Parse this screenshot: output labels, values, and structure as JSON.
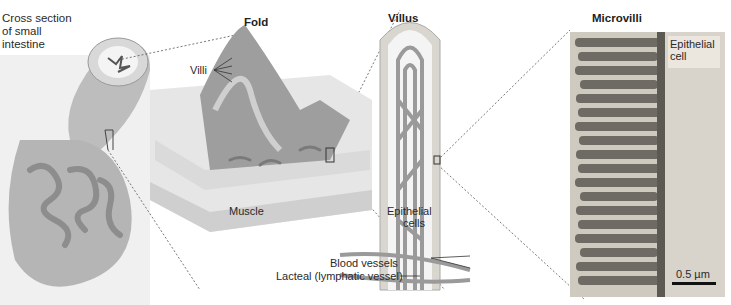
{
  "panels": {
    "cross_section": {
      "title_lines": [
        "Cross section",
        "of small",
        "intestine"
      ]
    },
    "fold": {
      "title": "Fold",
      "labels": {
        "villi": "Villi",
        "muscle": "Muscle"
      }
    },
    "villus": {
      "title": "Villus",
      "labels": {
        "epithelial_cells_1": "Epithelial",
        "epithelial_cells_2": "cells",
        "blood_vessels": "Blood vessels",
        "lacteal": "Lacteal (lymphatic vessel)"
      }
    },
    "microvilli": {
      "title": "Microvilli",
      "labels": {
        "epithelial_cell_1": "Epithelial",
        "epithelial_cell_2": "cell"
      },
      "scale_bar": "0.5 µm"
    }
  },
  "colors": {
    "tissue": "#c8c8c8",
    "dark": "#8a8a8a",
    "micro_bg": "#cfcac0",
    "micro_rod": "#6a6560"
  }
}
